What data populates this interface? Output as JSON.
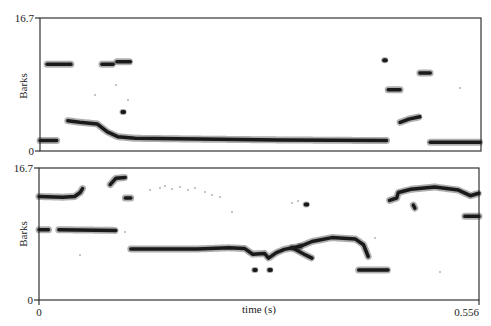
{
  "chart_data": [
    {
      "type": "scatter",
      "title": "",
      "panel": "upper",
      "xlabel": "",
      "ylabel": "Barks",
      "xlim": [
        0,
        0.556
      ],
      "ylim": [
        0,
        16.7
      ],
      "y_ticks": [
        "0",
        "16.7"
      ],
      "grid": false,
      "series": [
        {
          "name": "trace-1",
          "points": [
            [
              0.0,
              1.3
            ],
            [
              0.021,
              1.3
            ]
          ]
        },
        {
          "name": "trace-2",
          "points": [
            [
              0.009,
              10.9
            ],
            [
              0.039,
              10.9
            ]
          ]
        },
        {
          "name": "trace-3",
          "points": [
            [
              0.035,
              3.8
            ],
            [
              0.05,
              3.6
            ],
            [
              0.072,
              3.4
            ],
            [
              0.085,
              2.4
            ],
            [
              0.098,
              1.8
            ],
            [
              0.12,
              1.6
            ],
            [
              0.2,
              1.5
            ],
            [
              0.3,
              1.4
            ],
            [
              0.437,
              1.3
            ]
          ]
        },
        {
          "name": "trace-4",
          "points": [
            [
              0.078,
              10.9
            ],
            [
              0.092,
              10.9
            ]
          ]
        },
        {
          "name": "trace-5",
          "points": [
            [
              0.097,
              11.2
            ],
            [
              0.114,
              11.2
            ]
          ]
        },
        {
          "name": "trace-6",
          "points": [
            [
              0.104,
              4.9
            ],
            [
              0.106,
              4.9
            ]
          ]
        },
        {
          "name": "trace-7",
          "points": [
            [
              0.434,
              11.4
            ],
            [
              0.436,
              11.4
            ]
          ]
        },
        {
          "name": "trace-8",
          "points": [
            [
              0.439,
              7.7
            ],
            [
              0.454,
              7.7
            ]
          ]
        },
        {
          "name": "trace-9",
          "points": [
            [
              0.454,
              3.6
            ],
            [
              0.465,
              4.0
            ],
            [
              0.479,
              4.3
            ]
          ]
        },
        {
          "name": "trace-10",
          "points": [
            [
              0.479,
              9.8
            ],
            [
              0.492,
              9.8
            ]
          ]
        },
        {
          "name": "trace-11",
          "points": [
            [
              0.492,
              1.1
            ],
            [
              0.555,
              1.1
            ]
          ]
        }
      ]
    },
    {
      "type": "scatter",
      "title": "",
      "panel": "lower",
      "xlabel": "time (s)",
      "ylabel": "Barks",
      "xlim": [
        0,
        0.556
      ],
      "ylim": [
        0,
        16.7
      ],
      "x_ticks": [
        "0",
        "0.556"
      ],
      "y_ticks": [
        "0",
        "16.7"
      ],
      "grid": false,
      "series": [
        {
          "name": "trace-1",
          "points": [
            [
              0.0,
              13.1
            ],
            [
              0.03,
              13.0
            ],
            [
              0.045,
              13.1
            ],
            [
              0.052,
              13.6
            ],
            [
              0.055,
              14.1
            ]
          ]
        },
        {
          "name": "trace-2",
          "points": [
            [
              0.0,
              8.9
            ],
            [
              0.012,
              8.9
            ]
          ]
        },
        {
          "name": "trace-3",
          "points": [
            [
              0.025,
              8.9
            ],
            [
              0.097,
              8.8
            ]
          ]
        },
        {
          "name": "trace-4",
          "points": [
            [
              0.09,
              14.6
            ],
            [
              0.097,
              15.4
            ],
            [
              0.109,
              15.5
            ]
          ]
        },
        {
          "name": "trace-5",
          "points": [
            [
              0.109,
              12.9
            ],
            [
              0.116,
              12.9
            ]
          ]
        },
        {
          "name": "trace-6",
          "points": [
            [
              0.116,
              6.45
            ],
            [
              0.2,
              6.45
            ],
            [
              0.24,
              6.6
            ],
            [
              0.26,
              6.5
            ],
            [
              0.27,
              5.8
            ],
            [
              0.285,
              5.9
            ],
            [
              0.29,
              5.3
            ],
            [
              0.3,
              6.0
            ],
            [
              0.31,
              6.4
            ],
            [
              0.33,
              6.8
            ]
          ]
        },
        {
          "name": "trace-7",
          "points": [
            [
              0.33,
              6.8
            ],
            [
              0.345,
              7.4
            ],
            [
              0.37,
              7.9
            ],
            [
              0.4,
              7.7
            ],
            [
              0.41,
              7.0
            ],
            [
              0.416,
              5.5
            ]
          ]
        },
        {
          "name": "trace-8",
          "points": [
            [
              0.32,
              6.6
            ],
            [
              0.335,
              5.8
            ],
            [
              0.345,
              5.3
            ]
          ]
        },
        {
          "name": "trace-9",
          "points": [
            [
              0.272,
              3.8
            ],
            [
              0.274,
              3.8
            ]
          ]
        },
        {
          "name": "trace-10",
          "points": [
            [
              0.291,
              3.8
            ],
            [
              0.293,
              3.8
            ]
          ]
        },
        {
          "name": "trace-11",
          "points": [
            [
              0.404,
              3.8
            ],
            [
              0.441,
              3.8
            ]
          ]
        },
        {
          "name": "trace-12",
          "points": [
            [
              0.443,
              12.6
            ],
            [
              0.452,
              12.9
            ],
            [
              0.454,
              13.6
            ],
            [
              0.47,
              14.0
            ],
            [
              0.5,
              14.3
            ],
            [
              0.53,
              13.9
            ],
            [
              0.545,
              13.2
            ],
            [
              0.556,
              13.5
            ]
          ]
        },
        {
          "name": "trace-13",
          "points": [
            [
              0.538,
              10.6
            ],
            [
              0.556,
              10.6
            ]
          ]
        },
        {
          "name": "trace-14",
          "points": [
            [
              0.337,
              12.1
            ],
            [
              0.339,
              12.1
            ]
          ]
        },
        {
          "name": "trace-15",
          "points": [
            [
              0.473,
              12.0
            ],
            [
              0.475,
              11.6
            ]
          ]
        }
      ]
    }
  ],
  "labels": {
    "upper_ylabel": "Barks",
    "lower_ylabel": "Barks",
    "upper_ymax": "16.7",
    "upper_ymin": "0",
    "lower_ymax": "16.7",
    "lower_ymin": "0",
    "xmin": "0",
    "xmax": "0.556",
    "xlabel": "time (s)"
  },
  "colors": {
    "trace": "#1a1a1a",
    "frame": "#333333",
    "background": "#ffffff"
  }
}
